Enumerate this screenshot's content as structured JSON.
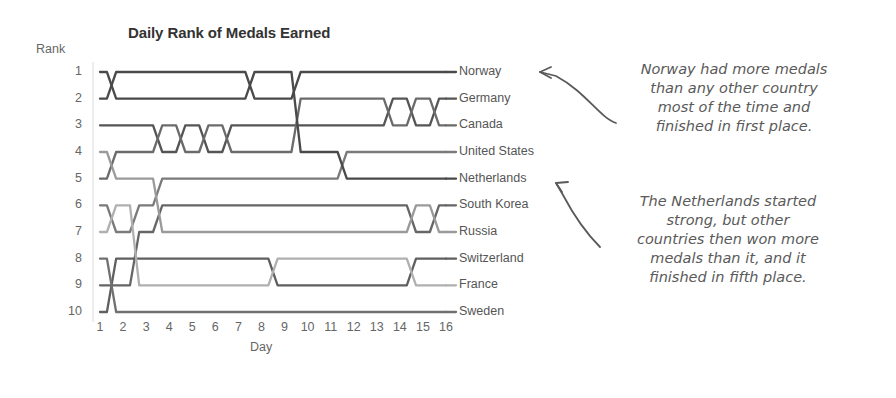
{
  "chart_title": "Daily Rank of Medals Earned",
  "axis": {
    "y_label": "Rank",
    "x_label": "Day",
    "rank_ticks": [
      "1",
      "2",
      "3",
      "4",
      "5",
      "6",
      "7",
      "8",
      "9",
      "10"
    ],
    "day_ticks": [
      "1",
      "2",
      "3",
      "4",
      "5",
      "6",
      "7",
      "8",
      "9",
      "10",
      "11",
      "12",
      "13",
      "14",
      "15",
      "16"
    ]
  },
  "annotations": {
    "norway": "Norway had more medals\nthan any other country\nmost of the time and\nfinished in first place.",
    "netherlands": "The Netherlands started\nstrong, but other\ncountries then won more\nmedals than it, and it\nfinished in fifth place."
  },
  "chart_data": {
    "type": "line",
    "subtype": "bump-chart",
    "title": "Daily Rank of Medals Earned",
    "xlabel": "Day",
    "ylabel": "Rank",
    "x": [
      1,
      2,
      3,
      4,
      5,
      6,
      7,
      8,
      9,
      10,
      11,
      12,
      13,
      14,
      15,
      16
    ],
    "ylim": [
      1,
      10
    ],
    "y_inverted": true,
    "grid": false,
    "legend": "right-end-labels",
    "series": [
      {
        "name": "Norway",
        "final_rank": 1,
        "color": "#4a4a4a",
        "values": [
          2,
          1,
          1,
          1,
          1,
          1,
          1,
          2,
          2,
          1,
          1,
          1,
          1,
          1,
          1,
          1
        ]
      },
      {
        "name": "Germany",
        "final_rank": 2,
        "color": "#555555",
        "values": [
          3,
          3,
          3,
          4,
          3,
          4,
          3,
          3,
          3,
          3,
          3,
          3,
          3,
          2,
          3,
          2
        ]
      },
      {
        "name": "Canada",
        "final_rank": 3,
        "color": "#6b6b6b",
        "values": [
          5,
          4,
          4,
          3,
          4,
          3,
          4,
          4,
          4,
          2,
          2,
          2,
          2,
          3,
          2,
          3
        ]
      },
      {
        "name": "United States",
        "final_rank": 4,
        "color": "#7a7a7a",
        "values": [
          6,
          7,
          6,
          5,
          5,
          5,
          5,
          5,
          5,
          5,
          5,
          4,
          4,
          4,
          4,
          4
        ]
      },
      {
        "name": "Netherlands",
        "final_rank": 5,
        "color": "#4a4a4a",
        "values": [
          1,
          2,
          2,
          2,
          2,
          2,
          2,
          1,
          1,
          4,
          4,
          5,
          5,
          5,
          5,
          5
        ]
      },
      {
        "name": "South Korea",
        "final_rank": 6,
        "color": "#666666",
        "values": [
          9,
          9,
          7,
          6,
          6,
          6,
          6,
          6,
          6,
          6,
          6,
          6,
          6,
          6,
          7,
          6
        ]
      },
      {
        "name": "Russia",
        "final_rank": 7,
        "color": "#9a9a9a",
        "values": [
          4,
          5,
          5,
          7,
          7,
          7,
          7,
          7,
          7,
          7,
          7,
          7,
          7,
          7,
          6,
          7
        ]
      },
      {
        "name": "Switzerland",
        "final_rank": 8,
        "color": "#5f5f5f",
        "values": [
          10,
          8,
          8,
          8,
          8,
          8,
          8,
          8,
          9,
          9,
          9,
          9,
          9,
          9,
          8,
          8
        ]
      },
      {
        "name": "France",
        "final_rank": 9,
        "color": "#b0b0b0",
        "values": [
          7,
          6,
          9,
          9,
          9,
          9,
          9,
          9,
          8,
          8,
          8,
          8,
          8,
          8,
          9,
          9
        ]
      },
      {
        "name": "Sweden",
        "final_rank": 10,
        "color": "#707070",
        "values": [
          8,
          10,
          10,
          10,
          10,
          10,
          10,
          10,
          10,
          10,
          10,
          10,
          10,
          10,
          10,
          10
        ]
      }
    ]
  },
  "colors": {
    "background": "#ffffff",
    "axis_text": "#666666",
    "title_text": "#333333",
    "label_text": "#555555",
    "annotation_text": "#5a5a5a"
  }
}
